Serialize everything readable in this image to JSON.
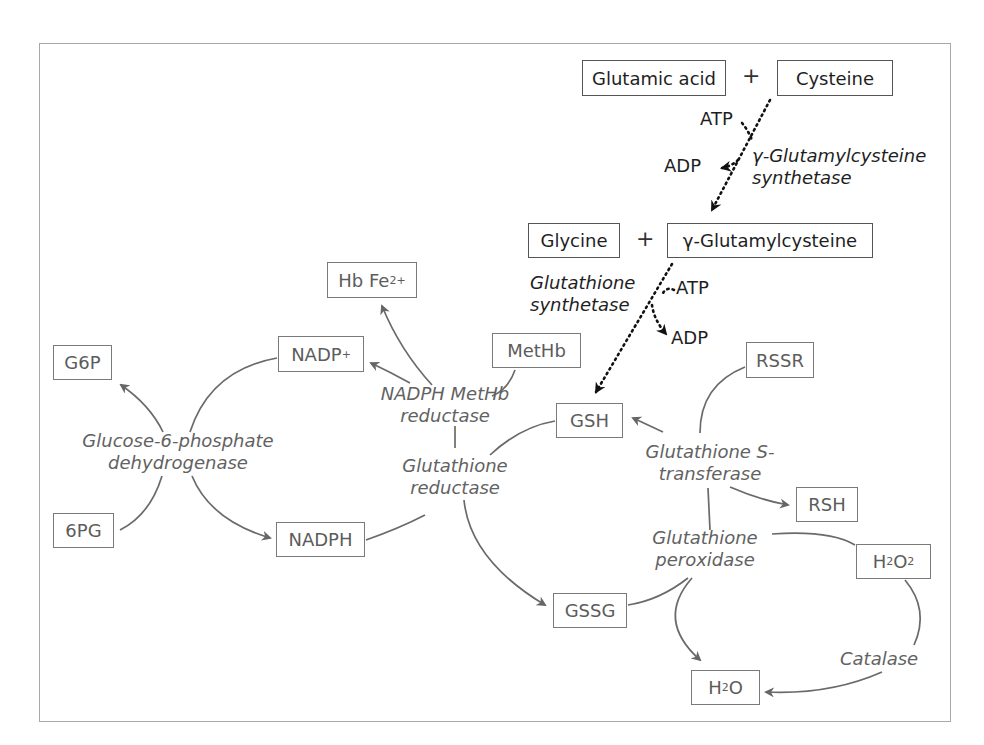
{
  "diagram": {
    "synthesis": {
      "glutamic_acid": "Glutamic acid",
      "plus1": "+",
      "cysteine": "Cysteine",
      "atp1": "ATP",
      "adp1": "ADP",
      "enzyme1_line1": "γ-Glutamylcysteine",
      "enzyme1_line2": "synthetase",
      "glycine": "Glycine",
      "plus2": "+",
      "gamma_glutamylcysteine": "γ-Glutamylcysteine",
      "enzyme2_line1": "Glutathione",
      "enzyme2_line2": "synthetase",
      "atp2": "ATP",
      "adp2": "ADP"
    },
    "nodes": {
      "hb_fe": "Hb Fe",
      "hb_fe_sup": "2+",
      "g6p": "G6P",
      "nadp_plus": "NADP",
      "nadp_sup": "+",
      "methb": "MetHb",
      "gsh": "GSH",
      "rssr": "RSSR",
      "pg6": "6PG",
      "nadph": "NADPH",
      "rsh": "RSH",
      "h2o2_h": "H",
      "h2o2_sub1": "2",
      "h2o2_o": "O",
      "h2o2_sub2": "2",
      "gssg": "GSSG",
      "h2o_h": "H",
      "h2o_sub": "2",
      "h2o_o": "O"
    },
    "enzymes": {
      "g6pd_line1": "Glucose-6-phosphate",
      "g6pd_line2": "dehydrogenase",
      "methb_red_line1": "NADPH MetHb",
      "methb_red_line2": "reductase",
      "gr_line1": "Glutathione",
      "gr_line2": "reductase",
      "gst_line1": "Glutathione S-",
      "gst_line2": "transferase",
      "gpx_line1": "Glutathione",
      "gpx_line2": "peroxidase",
      "catalase": "Catalase"
    },
    "colors": {
      "synthesis_ink": "#1e1e1e",
      "cycle_ink": "#626262",
      "frame": "#a8a8a8"
    }
  }
}
